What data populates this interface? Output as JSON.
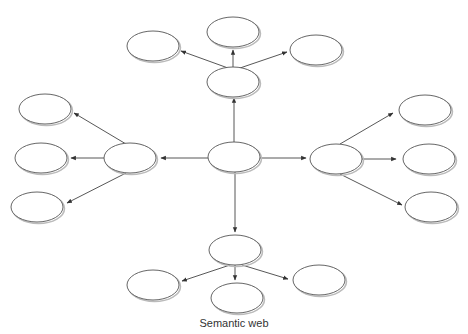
{
  "diagram": {
    "caption": "Semantic web",
    "colors": {
      "stroke": "#555555",
      "fill": "#ffffff",
      "shadow": "#bbbbbb",
      "edge": "#444444"
    },
    "nodes": [
      {
        "id": "center",
        "cx": 234,
        "cy": 157,
        "rx": 26,
        "ry": 15,
        "label": ""
      },
      {
        "id": "top-mid",
        "cx": 233,
        "cy": 82,
        "rx": 26,
        "ry": 15,
        "label": ""
      },
      {
        "id": "top",
        "cx": 233,
        "cy": 32,
        "rx": 26,
        "ry": 15,
        "label": ""
      },
      {
        "id": "top-left",
        "cx": 153,
        "cy": 46,
        "rx": 26,
        "ry": 15,
        "label": ""
      },
      {
        "id": "top-right",
        "cx": 316,
        "cy": 50,
        "rx": 26,
        "ry": 15,
        "label": ""
      },
      {
        "id": "left-mid",
        "cx": 130,
        "cy": 158,
        "rx": 26,
        "ry": 15,
        "label": ""
      },
      {
        "id": "left-top",
        "cx": 45,
        "cy": 109,
        "rx": 26,
        "ry": 15,
        "label": ""
      },
      {
        "id": "left-center",
        "cx": 41,
        "cy": 158,
        "rx": 26,
        "ry": 15,
        "label": ""
      },
      {
        "id": "left-bottom",
        "cx": 37,
        "cy": 207,
        "rx": 26,
        "ry": 15,
        "label": ""
      },
      {
        "id": "right-mid",
        "cx": 336,
        "cy": 159,
        "rx": 26,
        "ry": 15,
        "label": ""
      },
      {
        "id": "right-top",
        "cx": 425,
        "cy": 110,
        "rx": 26,
        "ry": 15,
        "label": ""
      },
      {
        "id": "right-center",
        "cx": 429,
        "cy": 159,
        "rx": 26,
        "ry": 15,
        "label": ""
      },
      {
        "id": "right-bottom",
        "cx": 431,
        "cy": 207,
        "rx": 26,
        "ry": 15,
        "label": ""
      },
      {
        "id": "bottom-mid",
        "cx": 235,
        "cy": 250,
        "rx": 26,
        "ry": 15,
        "label": ""
      },
      {
        "id": "bottom-left",
        "cx": 153,
        "cy": 285,
        "rx": 26,
        "ry": 15,
        "label": ""
      },
      {
        "id": "bottom-center",
        "cx": 237,
        "cy": 298,
        "rx": 26,
        "ry": 15,
        "label": ""
      },
      {
        "id": "bottom-right",
        "cx": 319,
        "cy": 280,
        "rx": 26,
        "ry": 15,
        "label": ""
      }
    ],
    "edges": [
      {
        "from": "center",
        "to": "top-mid",
        "x1": 234,
        "y1": 142,
        "x2": 234,
        "y2": 98
      },
      {
        "from": "center",
        "to": "left-mid",
        "x1": 208,
        "y1": 158,
        "x2": 161,
        "y2": 158
      },
      {
        "from": "center",
        "to": "right-mid",
        "x1": 260,
        "y1": 158,
        "x2": 306,
        "y2": 158
      },
      {
        "from": "center",
        "to": "bottom-mid",
        "x1": 235,
        "y1": 172,
        "x2": 235,
        "y2": 232
      },
      {
        "from": "top-mid",
        "to": "top",
        "x1": 233,
        "y1": 67,
        "x2": 233,
        "y2": 50
      },
      {
        "from": "top-mid",
        "to": "top-left",
        "x1": 228,
        "y1": 68,
        "x2": 181,
        "y2": 51
      },
      {
        "from": "top-mid",
        "to": "top-right",
        "x1": 240,
        "y1": 68,
        "x2": 287,
        "y2": 52
      },
      {
        "from": "left-mid",
        "to": "left-top",
        "x1": 126,
        "y1": 144,
        "x2": 74,
        "y2": 113
      },
      {
        "from": "left-mid",
        "to": "left-center",
        "x1": 104,
        "y1": 158,
        "x2": 71,
        "y2": 158
      },
      {
        "from": "left-mid",
        "to": "left-bottom",
        "x1": 126,
        "y1": 173,
        "x2": 67,
        "y2": 203
      },
      {
        "from": "right-mid",
        "to": "right-top",
        "x1": 340,
        "y1": 144,
        "x2": 393,
        "y2": 113
      },
      {
        "from": "right-mid",
        "to": "right-center",
        "x1": 362,
        "y1": 159,
        "x2": 396,
        "y2": 159
      },
      {
        "from": "right-mid",
        "to": "right-bottom",
        "x1": 340,
        "y1": 174,
        "x2": 402,
        "y2": 205
      },
      {
        "from": "bottom-mid",
        "to": "bottom-left",
        "x1": 230,
        "y1": 265,
        "x2": 182,
        "y2": 281
      },
      {
        "from": "bottom-mid",
        "to": "bottom-center",
        "x1": 235,
        "y1": 265,
        "x2": 235,
        "y2": 280
      },
      {
        "from": "bottom-mid",
        "to": "bottom-right",
        "x1": 242,
        "y1": 265,
        "x2": 288,
        "y2": 279
      }
    ]
  }
}
